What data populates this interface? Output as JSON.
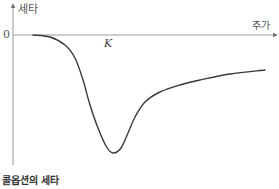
{
  "chart_data": {
    "type": "line",
    "title": "콜옵션의 세타",
    "xlabel": "주가",
    "ylabel": "세타",
    "annotations": [
      {
        "text": "0",
        "position": "y-axis origin"
      },
      {
        "text": "K",
        "position": "x-axis, strike price"
      }
    ],
    "grid": false,
    "legend": null,
    "series": [
      {
        "name": "콜옵션의 세타",
        "description": "Theta is ~0 for low stock prices, falls sharply to a negative minimum near the strike K, then rises back toward 0 (asymptotically negative) as the stock price increases.",
        "points_px": [
          [
            33,
            35
          ],
          [
            50,
            37
          ],
          [
            65,
            45
          ],
          [
            75,
            58
          ],
          [
            83,
            80
          ],
          [
            90,
            105
          ],
          [
            98,
            128
          ],
          [
            106,
            146
          ],
          [
            113,
            153
          ],
          [
            121,
            148
          ],
          [
            128,
            133
          ],
          [
            135,
            117
          ],
          [
            145,
            102
          ],
          [
            160,
            92
          ],
          [
            180,
            85
          ],
          [
            200,
            80
          ],
          [
            230,
            74
          ],
          [
            265,
            70
          ]
        ]
      }
    ],
    "axes": {
      "x_axis_y_px": 35,
      "y_axis_x_px": 13
    },
    "colors": {
      "axis": "#9a9a9a",
      "curve": "#3a3a3a"
    }
  },
  "labels": {
    "y_axis": "세타",
    "zero": "0",
    "x_axis": "주가",
    "strike": "K",
    "caption": "콜옵션의 세타"
  }
}
